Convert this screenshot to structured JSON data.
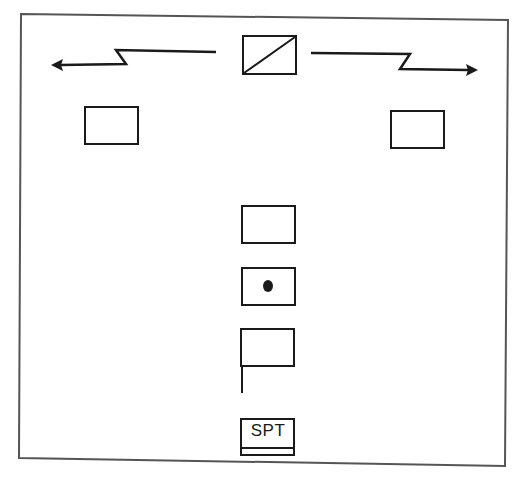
{
  "diagram": {
    "title": "",
    "frame": {
      "stroke": "#555555"
    },
    "ink_color": "#1a1a1a",
    "elements": [
      {
        "id": "boundary-line",
        "type": "zigzag-arrow-pair",
        "description": "Boundary line extending left and right from central symbol"
      },
      {
        "id": "center-symbol",
        "type": "rectangle-with-diagonal"
      },
      {
        "id": "left-unit",
        "type": "rectangle"
      },
      {
        "id": "right-unit",
        "type": "rectangle"
      },
      {
        "id": "center-box-1",
        "type": "rectangle"
      },
      {
        "id": "center-box-2",
        "type": "rectangle-with-dot"
      },
      {
        "id": "center-box-3",
        "type": "rectangle-with-staff"
      },
      {
        "id": "spt-box",
        "type": "labeled-rectangle",
        "label": "SPT"
      }
    ],
    "spt_label": "SPT"
  }
}
